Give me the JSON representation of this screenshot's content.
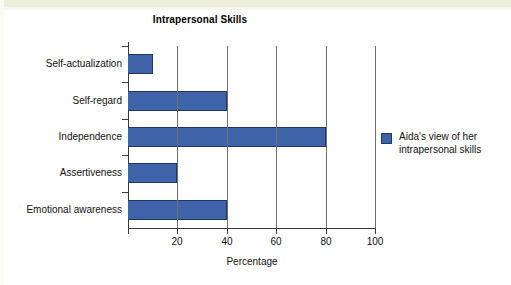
{
  "chart_data": {
    "type": "bar",
    "orientation": "horizontal",
    "title": "Intrapersonal Skills",
    "xlabel": "Percentage",
    "ylabel": "",
    "xlim": [
      0,
      100
    ],
    "xticks": [
      0,
      20,
      40,
      60,
      80,
      100
    ],
    "xtick_labels": [
      "",
      "20",
      "40",
      "60",
      "80",
      "100"
    ],
    "grid": "vertical",
    "categories": [
      "Self-actualization",
      "Self-regard",
      "Independence",
      "Assertiveness",
      "Emotional awareness"
    ],
    "values": [
      10,
      40,
      80,
      20,
      40
    ],
    "series": [
      {
        "name": "Aida's view of her intrapersonal skills",
        "values": [
          10,
          40,
          80,
          20,
          40
        ],
        "color": "#3e63a8"
      }
    ],
    "legend": {
      "position": "right",
      "entries": [
        {
          "label_line_1": "Aida's view of her",
          "label_line_2": "intrapersonal skills",
          "color": "#3e63a8"
        }
      ]
    },
    "colors": {
      "bar_fill": "#3e63a8",
      "bar_border": "#1f3864",
      "axis": "#3a3a3a",
      "gridline": "#6e6e6e",
      "background": "#ffffff",
      "text": "#111111"
    }
  }
}
